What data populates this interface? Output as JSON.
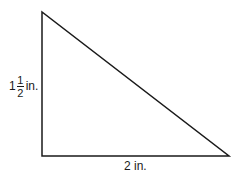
{
  "diagram": {
    "shape": "right-triangle",
    "vertices": {
      "top": [
        42,
        12
      ],
      "right_angle": [
        42,
        156
      ],
      "right": [
        229,
        156
      ]
    },
    "labels": {
      "height": {
        "whole": "1",
        "numerator": "1",
        "denominator": "2",
        "unit": "in."
      },
      "base": {
        "text": "2 in."
      }
    },
    "stroke_color": "#1a1a1a"
  }
}
